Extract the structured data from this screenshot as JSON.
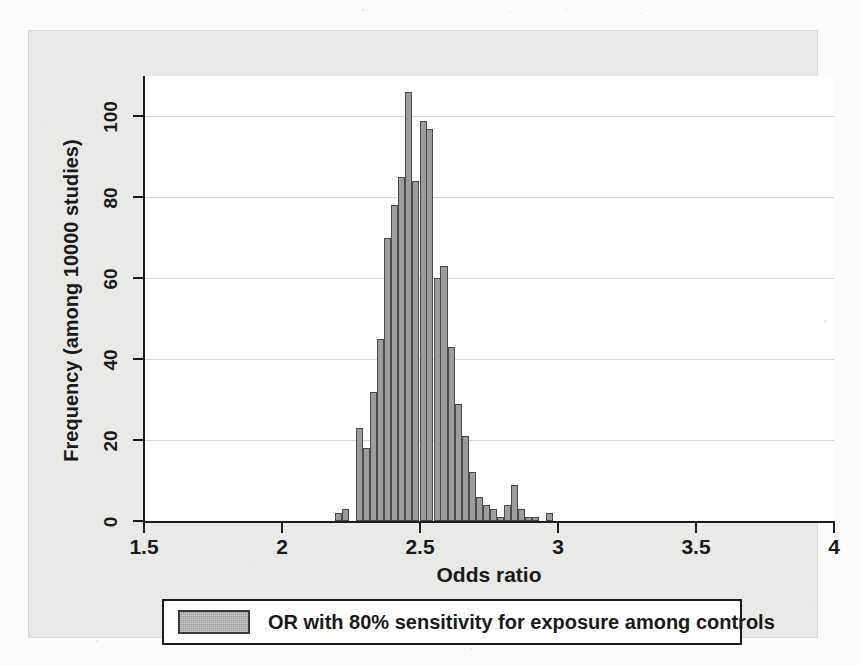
{
  "figure": {
    "background_color": "#fcfcfc",
    "graph_region_color": "#e9e9e7",
    "plot_area_color": "#ffffff",
    "bar_fill_color": "#9c9c9c",
    "bar_outline_color": "#4a4a4a",
    "gridline_color": "#d6d6d6",
    "axis_color": "#1d1d1d"
  },
  "legend": {
    "label": "OR with 80% sensitivity for exposure among controls",
    "swatch_name": "bar-color-swatch"
  },
  "chart_data": {
    "type": "bar",
    "subtype": "histogram",
    "title": "",
    "subtitle": "",
    "xlabel": "Odds ratio",
    "ylabel": "Frequency (among 10000 studies)",
    "xlim": [
      1.5,
      4.0
    ],
    "ylim": [
      0,
      110
    ],
    "xticks": [
      1.5,
      2,
      2.5,
      3,
      3.5,
      4
    ],
    "xticklabels": [
      "1.5",
      "2",
      "2.5",
      "3",
      "3.5",
      "4"
    ],
    "yticks": [
      0,
      20,
      40,
      60,
      80,
      100
    ],
    "yticklabels": [
      "0",
      "20",
      "40",
      "60",
      "80",
      "100"
    ],
    "gridlines_y": [
      20,
      40,
      60,
      80,
      100
    ],
    "grid": "horizontal",
    "legend_position": "below-axis-centered",
    "bin_width": 0.0255,
    "series": [
      {
        "name": "OR with 80% sensitivity for exposure among controls",
        "color": "#9c9c9c",
        "x": [
          2.205,
          2.23,
          2.281,
          2.307,
          2.332,
          2.358,
          2.383,
          2.409,
          2.434,
          2.46,
          2.485,
          2.511,
          2.536,
          2.562,
          2.587,
          2.613,
          2.638,
          2.664,
          2.689,
          2.715,
          2.74,
          2.766,
          2.791,
          2.817,
          2.842,
          2.868,
          2.893,
          2.919,
          2.97
        ],
        "values": [
          2,
          3,
          23,
          18,
          32,
          45,
          70,
          78,
          85,
          106,
          84,
          99,
          97,
          60,
          63,
          43,
          29,
          21,
          12,
          6,
          4,
          3,
          1,
          4,
          9,
          3,
          1,
          1,
          2
        ]
      }
    ]
  }
}
